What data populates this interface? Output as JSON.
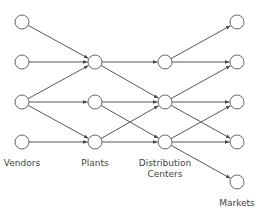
{
  "diagram": {
    "type": "supply-chain-network",
    "style": {
      "node_radius": 7,
      "node_stroke": "#555555",
      "node_fill": "#ffffff",
      "edge_color": "#444444",
      "label_color": "#444444"
    },
    "columns": [
      {
        "id": "vendors",
        "label": "Vendors",
        "label_lines": [
          "Vendors"
        ],
        "x": 22,
        "label_y": 158
      },
      {
        "id": "plants",
        "label": "Plants",
        "label_lines": [
          "Plants"
        ],
        "x": 95,
        "label_y": 158
      },
      {
        "id": "dcs",
        "label": "Distribution Centers",
        "label_lines": [
          "Distribution",
          "Centers"
        ],
        "x": 165,
        "label_y": 158
      },
      {
        "id": "markets",
        "label": "Markets",
        "label_lines": [
          "Markets"
        ],
        "x": 237,
        "label_y": 198
      }
    ],
    "nodes": [
      {
        "id": "V1",
        "col": "vendors",
        "x": 22,
        "y": 22
      },
      {
        "id": "V2",
        "col": "vendors",
        "x": 22,
        "y": 62
      },
      {
        "id": "V3",
        "col": "vendors",
        "x": 22,
        "y": 102
      },
      {
        "id": "V4",
        "col": "vendors",
        "x": 22,
        "y": 142
      },
      {
        "id": "P1",
        "col": "plants",
        "x": 95,
        "y": 62
      },
      {
        "id": "P2",
        "col": "plants",
        "x": 95,
        "y": 102
      },
      {
        "id": "P3",
        "col": "plants",
        "x": 95,
        "y": 142
      },
      {
        "id": "D1",
        "col": "dcs",
        "x": 165,
        "y": 62
      },
      {
        "id": "D2",
        "col": "dcs",
        "x": 165,
        "y": 102
      },
      {
        "id": "D3",
        "col": "dcs",
        "x": 165,
        "y": 142
      },
      {
        "id": "M1",
        "col": "markets",
        "x": 237,
        "y": 22
      },
      {
        "id": "M2",
        "col": "markets",
        "x": 237,
        "y": 62
      },
      {
        "id": "M3",
        "col": "markets",
        "x": 237,
        "y": 102
      },
      {
        "id": "M4",
        "col": "markets",
        "x": 237,
        "y": 142
      },
      {
        "id": "M5",
        "col": "markets",
        "x": 237,
        "y": 182
      }
    ],
    "edges": [
      [
        "V1",
        "P1"
      ],
      [
        "V2",
        "P1"
      ],
      [
        "V3",
        "P1"
      ],
      [
        "V3",
        "P2"
      ],
      [
        "V3",
        "P3"
      ],
      [
        "V4",
        "P3"
      ],
      [
        "P1",
        "D1"
      ],
      [
        "P1",
        "D2"
      ],
      [
        "P2",
        "D2"
      ],
      [
        "P2",
        "D3"
      ],
      [
        "P3",
        "D2"
      ],
      [
        "P3",
        "D3"
      ],
      [
        "D1",
        "M1"
      ],
      [
        "D1",
        "M2"
      ],
      [
        "D2",
        "M2"
      ],
      [
        "D2",
        "M3"
      ],
      [
        "D2",
        "M4"
      ],
      [
        "D3",
        "M3"
      ],
      [
        "D3",
        "M4"
      ],
      [
        "D3",
        "M5"
      ]
    ]
  }
}
